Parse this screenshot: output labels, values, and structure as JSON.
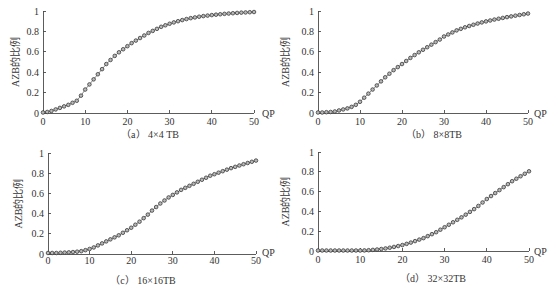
{
  "figure": {
    "panels": [
      "a",
      "b",
      "c",
      "d"
    ]
  },
  "chart_data": [
    {
      "type": "line",
      "panel": "a",
      "title": "（a） 4×4 TB",
      "xlabel": "QP",
      "ylabel": "AZB的比例",
      "xlim": [
        0,
        50
      ],
      "ylim": [
        0,
        1
      ],
      "grid": false,
      "legend": "none",
      "marker": "circle",
      "xticks": [
        "0",
        "10",
        "20",
        "30",
        "40",
        "50"
      ],
      "yticks": [
        "0",
        "0.2",
        "0.4",
        "0.6",
        "0.8",
        "1"
      ],
      "x": [
        0,
        1,
        2,
        3,
        4,
        5,
        6,
        7,
        8,
        9,
        10,
        11,
        12,
        13,
        14,
        15,
        16,
        17,
        18,
        19,
        20,
        21,
        22,
        23,
        24,
        25,
        26,
        27,
        28,
        29,
        30,
        31,
        32,
        33,
        34,
        35,
        36,
        37,
        38,
        39,
        40,
        41,
        42,
        43,
        44,
        45,
        46,
        47,
        48,
        49,
        50
      ],
      "values": [
        0.005,
        0.01,
        0.02,
        0.035,
        0.05,
        0.065,
        0.08,
        0.1,
        0.12,
        0.17,
        0.23,
        0.28,
        0.33,
        0.38,
        0.43,
        0.48,
        0.52,
        0.56,
        0.595,
        0.625,
        0.655,
        0.685,
        0.71,
        0.735,
        0.76,
        0.785,
        0.805,
        0.825,
        0.845,
        0.86,
        0.875,
        0.888,
        0.9,
        0.911,
        0.921,
        0.93,
        0.937,
        0.944,
        0.95,
        0.955,
        0.96,
        0.964,
        0.968,
        0.972,
        0.975,
        0.978,
        0.981,
        0.984,
        0.986,
        0.988,
        0.99
      ]
    },
    {
      "type": "line",
      "panel": "b",
      "title": "（b） 8×8TB",
      "xlabel": "QP",
      "ylabel": "AZB的比例",
      "xlim": [
        0,
        50
      ],
      "ylim": [
        0,
        1
      ],
      "grid": false,
      "legend": "none",
      "marker": "circle",
      "xticks": [
        "0",
        "10",
        "20",
        "30",
        "40",
        "50"
      ],
      "yticks": [
        "0",
        "0.2",
        "0.4",
        "0.6",
        "0.8",
        "1"
      ],
      "x": [
        0,
        1,
        2,
        3,
        4,
        5,
        6,
        7,
        8,
        9,
        10,
        11,
        12,
        13,
        14,
        15,
        16,
        17,
        18,
        19,
        20,
        21,
        22,
        23,
        24,
        25,
        26,
        27,
        28,
        29,
        30,
        31,
        32,
        33,
        34,
        35,
        36,
        37,
        38,
        39,
        40,
        41,
        42,
        43,
        44,
        45,
        46,
        47,
        48,
        49,
        50
      ],
      "values": [
        0.005,
        0.005,
        0.008,
        0.01,
        0.015,
        0.025,
        0.035,
        0.045,
        0.06,
        0.08,
        0.11,
        0.15,
        0.19,
        0.23,
        0.27,
        0.31,
        0.35,
        0.385,
        0.42,
        0.45,
        0.48,
        0.51,
        0.54,
        0.568,
        0.595,
        0.62,
        0.645,
        0.67,
        0.695,
        0.72,
        0.75,
        0.77,
        0.79,
        0.81,
        0.825,
        0.84,
        0.853,
        0.865,
        0.877,
        0.888,
        0.898,
        0.907,
        0.916,
        0.924,
        0.932,
        0.94,
        0.947,
        0.954,
        0.961,
        0.968,
        0.975
      ]
    },
    {
      "type": "line",
      "panel": "c",
      "title": "（c） 16×16TB",
      "xlabel": "QP",
      "ylabel": "AZB的比例",
      "xlim": [
        0,
        50
      ],
      "ylim": [
        0,
        1
      ],
      "grid": false,
      "legend": "none",
      "marker": "circle",
      "xticks": [
        "0",
        "10",
        "20",
        "30",
        "40",
        "50"
      ],
      "yticks": [
        "0",
        "0.2",
        "0.4",
        "0.6",
        "0.8",
        "1"
      ],
      "x": [
        0,
        1,
        2,
        3,
        4,
        5,
        6,
        7,
        8,
        9,
        10,
        11,
        12,
        13,
        14,
        15,
        16,
        17,
        18,
        19,
        20,
        21,
        22,
        23,
        24,
        25,
        26,
        27,
        28,
        29,
        30,
        31,
        32,
        33,
        34,
        35,
        36,
        37,
        38,
        39,
        40,
        41,
        42,
        43,
        44,
        45,
        46,
        47,
        48,
        49,
        50
      ],
      "values": [
        0.01,
        0.01,
        0.01,
        0.012,
        0.014,
        0.016,
        0.019,
        0.023,
        0.028,
        0.038,
        0.05,
        0.065,
        0.085,
        0.105,
        0.125,
        0.145,
        0.165,
        0.185,
        0.21,
        0.235,
        0.26,
        0.29,
        0.32,
        0.355,
        0.39,
        0.43,
        0.465,
        0.5,
        0.53,
        0.56,
        0.585,
        0.61,
        0.635,
        0.655,
        0.675,
        0.695,
        0.715,
        0.735,
        0.755,
        0.775,
        0.79,
        0.805,
        0.82,
        0.835,
        0.85,
        0.863,
        0.876,
        0.889,
        0.901,
        0.913,
        0.925
      ]
    },
    {
      "type": "line",
      "panel": "d",
      "title": "（d） 32×32TB",
      "xlabel": "QP",
      "ylabel": "AZB的比例",
      "xlim": [
        0,
        50
      ],
      "ylim": [
        0,
        1
      ],
      "grid": false,
      "legend": "none",
      "marker": "circle",
      "xticks": [
        "0",
        "10",
        "20",
        "30",
        "40",
        "50"
      ],
      "yticks": [
        "0",
        "0.2",
        "0.4",
        "0.6",
        "0.8",
        "1"
      ],
      "x": [
        0,
        1,
        2,
        3,
        4,
        5,
        6,
        7,
        8,
        9,
        10,
        11,
        12,
        13,
        14,
        15,
        16,
        17,
        18,
        19,
        20,
        21,
        22,
        23,
        24,
        25,
        26,
        27,
        28,
        29,
        30,
        31,
        32,
        33,
        34,
        35,
        36,
        37,
        38,
        39,
        40,
        41,
        42,
        43,
        44,
        45,
        46,
        47,
        48,
        49,
        50
      ],
      "values": [
        0.005,
        0.005,
        0.005,
        0.005,
        0.005,
        0.005,
        0.005,
        0.005,
        0.005,
        0.005,
        0.005,
        0.006,
        0.008,
        0.011,
        0.015,
        0.02,
        0.026,
        0.033,
        0.041,
        0.05,
        0.06,
        0.072,
        0.085,
        0.1,
        0.115,
        0.13,
        0.15,
        0.17,
        0.19,
        0.215,
        0.24,
        0.265,
        0.29,
        0.315,
        0.34,
        0.367,
        0.395,
        0.423,
        0.455,
        0.49,
        0.525,
        0.555,
        0.585,
        0.615,
        0.645,
        0.675,
        0.705,
        0.73,
        0.755,
        0.78,
        0.805
      ]
    }
  ]
}
